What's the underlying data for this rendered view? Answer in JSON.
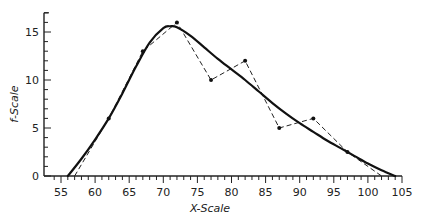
{
  "chart_data": {
    "type": "line",
    "title": "",
    "xlabel": "X-Scale",
    "ylabel": "f-Scale",
    "xlim": [
      53,
      105
    ],
    "ylim": [
      0,
      17
    ],
    "x_ticks": [
      55,
      60,
      65,
      70,
      75,
      80,
      85,
      90,
      95,
      100,
      105
    ],
    "y_ticks": [
      0,
      5,
      10,
      15
    ],
    "x_minor_step": 1,
    "y_minor_step": 1,
    "grid": false,
    "legend": null,
    "series": [
      {
        "name": "frequency polygon",
        "style": "dashed",
        "markers": true,
        "x": [
          57,
          62,
          67,
          72,
          77,
          82,
          87,
          92,
          97,
          102
        ],
        "y": [
          0,
          6,
          13,
          16,
          10,
          12,
          5,
          6,
          2.5,
          0
        ]
      },
      {
        "name": "smoothed curve",
        "style": "solid-thick",
        "markers": false,
        "x": [
          56,
          58,
          60,
          62,
          64,
          66,
          68,
          70,
          71,
          72,
          74,
          76,
          78,
          80,
          82,
          84,
          86,
          88,
          90,
          92,
          94,
          96,
          98,
          100,
          102,
          104
        ],
        "y": [
          0,
          1.8,
          3.8,
          6.0,
          8.6,
          11.4,
          13.9,
          15.4,
          15.6,
          15.5,
          14.6,
          13.4,
          12.2,
          11.1,
          10.0,
          8.8,
          7.6,
          6.5,
          5.5,
          4.6,
          3.7,
          2.9,
          2.1,
          1.3,
          0.6,
          0
        ]
      }
    ]
  },
  "axes": {
    "x_title": "X-Scale",
    "y_title": "f-Scale"
  }
}
